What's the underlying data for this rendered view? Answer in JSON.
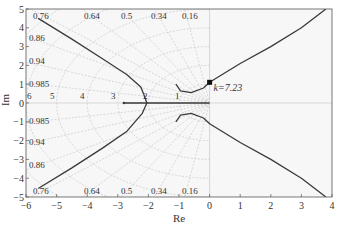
{
  "chart_data": {
    "type": "line",
    "title": "",
    "subtitle": "Root locus with s-plane damping / natural-frequency grid",
    "xlabel": "Re",
    "ylabel": "Im",
    "xlim": [
      -6,
      4
    ],
    "ylim": [
      -5,
      5
    ],
    "xticks": [
      -6,
      -5,
      -4,
      -3,
      -2,
      -1,
      0,
      1,
      2,
      3,
      4
    ],
    "yticks": [
      -5,
      -4,
      -3,
      -2,
      -1,
      0,
      1,
      2,
      3,
      4,
      5
    ],
    "grid": true,
    "legend": null,
    "damping_ratio_labels": [
      "0.76",
      "0.64",
      "0.5",
      "0.34",
      "0.16",
      "0.86",
      "0.94",
      "0.985"
    ],
    "damping_ratios": [
      0.16,
      0.34,
      0.5,
      0.64,
      0.76,
      0.86,
      0.94,
      0.985
    ],
    "natural_frequency_labels": [
      "6",
      "5",
      "4",
      "3",
      "2",
      "1"
    ],
    "natural_frequencies": [
      1,
      2,
      3,
      4,
      5,
      6
    ],
    "annotations": [
      {
        "text": "k=7.23",
        "x": 0.0,
        "y": 1.1,
        "marker": "square"
      }
    ],
    "series": [
      {
        "name": "branch-upper-left",
        "points": [
          [
            -5.6,
            4.5
          ],
          [
            -4.5,
            3.4
          ],
          [
            -3.5,
            2.35
          ],
          [
            -2.7,
            1.5
          ],
          [
            -2.25,
            0.85
          ],
          [
            -2.15,
            0.45
          ]
        ]
      },
      {
        "name": "branch-lower-left",
        "points": [
          [
            -2.15,
            0.45
          ],
          [
            -2.05,
            0.0
          ],
          [
            -2.2,
            -0.55
          ],
          [
            -2.7,
            -1.5
          ],
          [
            -3.5,
            -2.4
          ],
          [
            -4.5,
            -3.45
          ],
          [
            -5.6,
            -4.55
          ]
        ]
      },
      {
        "name": "real-axis-segment",
        "points": [
          [
            -2.8,
            0.0
          ],
          [
            0.0,
            0.0
          ]
        ]
      },
      {
        "name": "branch-upper-right",
        "points": [
          [
            -1.1,
            1.0
          ],
          [
            -0.95,
            0.65
          ],
          [
            -0.6,
            0.55
          ],
          [
            -0.2,
            0.8
          ],
          [
            0.0,
            1.1
          ],
          [
            1.0,
            2.1
          ],
          [
            2.0,
            3.0
          ],
          [
            3.0,
            4.0
          ],
          [
            3.8,
            5.0
          ]
        ]
      },
      {
        "name": "branch-lower-right",
        "points": [
          [
            -1.1,
            -1.0
          ],
          [
            -0.95,
            -0.65
          ],
          [
            -0.6,
            -0.55
          ],
          [
            -0.2,
            -0.8
          ],
          [
            0.0,
            -1.1
          ],
          [
            1.0,
            -2.1
          ],
          [
            2.0,
            -3.0
          ],
          [
            3.0,
            -4.0
          ],
          [
            3.8,
            -5.0
          ]
        ]
      }
    ]
  },
  "colors": {
    "curve": "#3a3a3a",
    "grid": "#c8c8c8",
    "frame": "#555555",
    "plot_bg": "#f7f7f7",
    "text": "#333333"
  }
}
